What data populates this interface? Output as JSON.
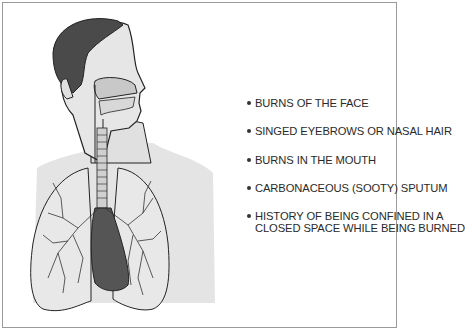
{
  "figure": {
    "colors": {
      "hair": "#4a4a4a",
      "skin": "#e0e0e0",
      "airway": "#c8c8c8",
      "heart": "#555555",
      "outline": "#222222",
      "border": "#9a9a9a"
    }
  },
  "signs": {
    "items": [
      {
        "text": "BURNS OF THE FACE"
      },
      {
        "text": "SINGED EYEBROWS OR NASAL HAIR"
      },
      {
        "text": "BURNS IN THE MOUTH"
      },
      {
        "text": "CARBONACEOUS (SOOTY) SPUTUM"
      },
      {
        "text": "HISTORY OF BEING CONFINED IN A",
        "text2": "CLOSED SPACE WHILE BEING BURNED"
      }
    ]
  }
}
